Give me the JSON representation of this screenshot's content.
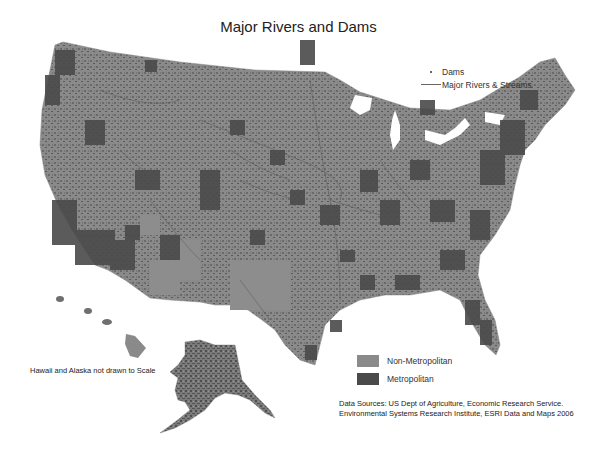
{
  "title": "Major Rivers and Dams",
  "legend_symbols": {
    "items": [
      {
        "symbol": "dot",
        "label": "Dams"
      },
      {
        "symbol": "line",
        "label": "Major Rivers & Streams"
      }
    ]
  },
  "legend_classes": {
    "items": [
      {
        "label": "Non-Metropolitan",
        "color": "#8a8a8a"
      },
      {
        "label": "Metropolitan",
        "color": "#4a4a4a"
      }
    ]
  },
  "scale_note": "Hawaii and Alaska not drawn to Scale",
  "sources": {
    "line1": "Data Sources: US Dept of Agriculture,  Economic Research Service.",
    "line2": "Environmental Systems Research Institute, ESRI Data and Maps 2006"
  },
  "colors": {
    "non_metro": "#8a8a8a",
    "metro": "#4a4a4a",
    "rivers": "#555555",
    "background": "#ffffff"
  }
}
